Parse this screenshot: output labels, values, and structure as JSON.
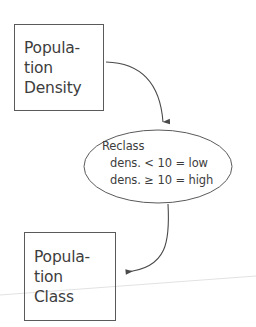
{
  "diagram": {
    "background_color": "#ffffff",
    "stroke_color": "#5a5a5a",
    "text_color": "#3d3d3d",
    "nodes": {
      "input": {
        "shape": "rectangle",
        "lines": [
          "Popula-",
          "tion",
          "Density"
        ],
        "full_text": "Population Density"
      },
      "process": {
        "shape": "ellipse",
        "lines": [
          "Reclass",
          "dens. < 10 = low",
          "dens. ≥ 10 = high"
        ],
        "heading": "Reclass",
        "rules": [
          {
            "field": "dens.",
            "operator": "<",
            "threshold": "10",
            "equals": "=",
            "result": "low"
          },
          {
            "field": "dens.",
            "operator": "≥",
            "threshold": "10",
            "equals": "=",
            "result": "high"
          }
        ]
      },
      "output": {
        "shape": "rectangle",
        "lines": [
          "Popula-",
          "tion",
          "Class"
        ],
        "full_text": "Population Class"
      }
    },
    "edges": [
      {
        "from": "input",
        "to": "process",
        "style": "curved-arrow",
        "direction": "down"
      },
      {
        "from": "process",
        "to": "output",
        "style": "curved-arrow",
        "direction": "left"
      }
    ]
  }
}
